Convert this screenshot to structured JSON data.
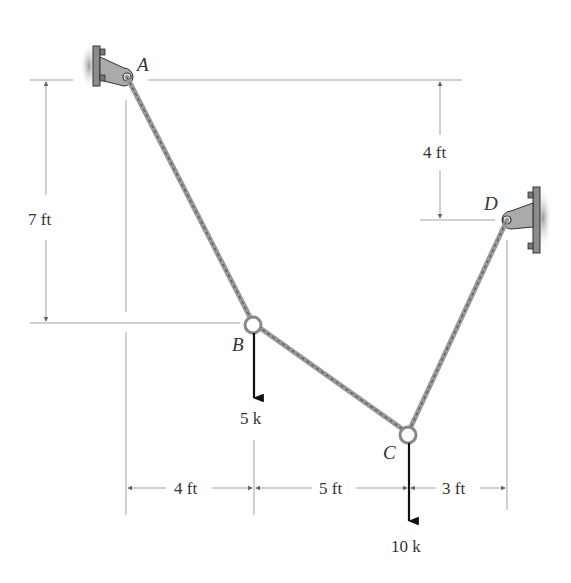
{
  "points": {
    "A": "A",
    "B": "B",
    "C": "C",
    "D": "D"
  },
  "loads": {
    "B": "5 k",
    "C": "10 k"
  },
  "dimensions": {
    "vertical_A_to_B": "7 ft",
    "vertical_A_to_D": "4 ft",
    "horizontal_A_to_B": "4 ft",
    "horizontal_B_to_C": "5 ft",
    "horizontal_C_to_D": "3 ft"
  },
  "colors": {
    "support": "#8c8c8c",
    "rope": "#9a9a9a",
    "dimension": "#8a8a8a",
    "load_arrow": "#111111"
  }
}
